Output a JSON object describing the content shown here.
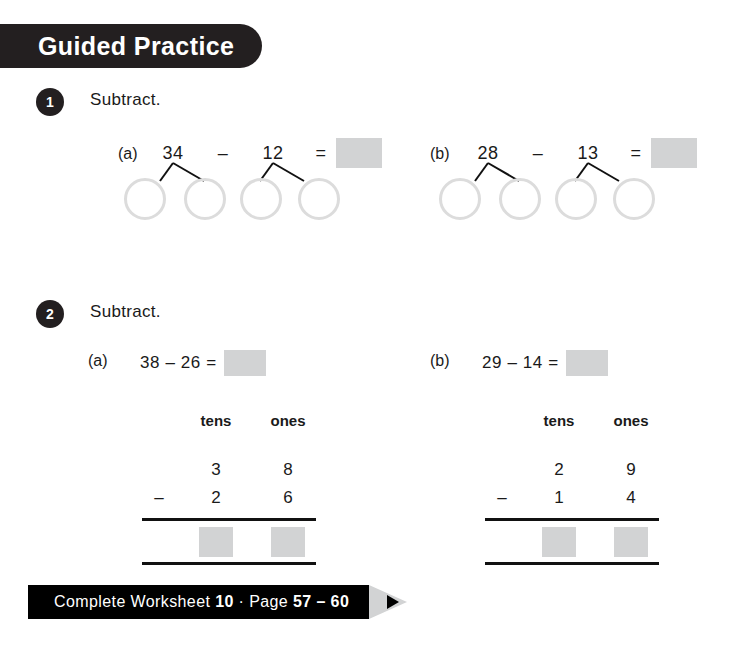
{
  "header": {
    "title": "Guided Practice"
  },
  "questions": [
    {
      "number": "1",
      "instruction": "Subtract.",
      "parts": [
        {
          "label": "(a)",
          "minuend": "34",
          "operator": "–",
          "subtrahend": "12",
          "equals": "=",
          "answer": "",
          "circles": [
            "",
            "",
            "",
            ""
          ]
        },
        {
          "label": "(b)",
          "minuend": "28",
          "operator": "–",
          "subtrahend": "13",
          "equals": "=",
          "answer": "",
          "circles": [
            "",
            "",
            "",
            ""
          ]
        }
      ]
    },
    {
      "number": "2",
      "instruction": "Subtract.",
      "parts": [
        {
          "label": "(a)",
          "expression": "38 – 26 =",
          "answer": "",
          "column": {
            "head_tens": "tens",
            "head_ones": "ones",
            "row1_tens": "3",
            "row1_ones": "8",
            "minus": "–",
            "row2_tens": "2",
            "row2_ones": "6",
            "result_tens": "",
            "result_ones": ""
          }
        },
        {
          "label": "(b)",
          "expression": "29 – 14 =",
          "answer": "",
          "column": {
            "head_tens": "tens",
            "head_ones": "ones",
            "row1_tens": "2",
            "row1_ones": "9",
            "minus": "–",
            "row2_tens": "1",
            "row2_ones": "4",
            "result_tens": "",
            "result_ones": ""
          }
        }
      ]
    }
  ],
  "footer": {
    "prefix": "Complete Worksheet ",
    "worksheet_number": "10",
    "separator": " · Page ",
    "page_range": "57 – 60"
  },
  "colors": {
    "banner": "#231f20",
    "answer_box": "#d2d3d4",
    "circle_outline": "#dcdcdc",
    "rule": "#111111"
  }
}
